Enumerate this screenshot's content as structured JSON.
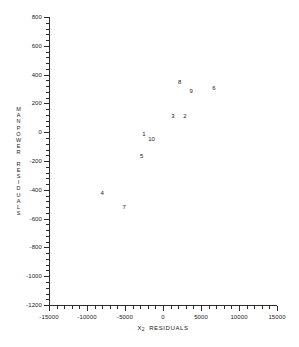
{
  "chart_data": {
    "type": "scatter",
    "title": "",
    "xlabel": "X₂ RESIDUALS",
    "ylabel": "MANPOWER RESIDUALS",
    "xlim": [
      -15000,
      15000
    ],
    "ylim": [
      -1200,
      800
    ],
    "grid": false,
    "legend": "none",
    "xticks": [
      -15000,
      -10000,
      -5000,
      0,
      5000,
      10000,
      15000
    ],
    "xtick_labels": [
      "-15000",
      "-10000",
      "-5000",
      "0",
      "5000",
      "10000",
      "15000"
    ],
    "yticks": [
      800,
      600,
      400,
      200,
      0,
      -200,
      -400,
      -600,
      -800,
      -1000,
      -1200
    ],
    "ytick_labels": [
      "800",
      "600",
      "400",
      "200",
      "0",
      "-200",
      "-400",
      "-600",
      "-800",
      "-1000",
      "-1200"
    ],
    "point_labels": [
      "1",
      "2",
      "3",
      "4",
      "5",
      "6",
      "7",
      "8",
      "9",
      "10"
    ],
    "points": [
      {
        "label": "1",
        "x": -2500,
        "y": -10
      },
      {
        "label": "10",
        "x": -1500,
        "y": -45
      },
      {
        "label": "5",
        "x": -2800,
        "y": -165
      },
      {
        "label": "3",
        "x": 1300,
        "y": 110
      },
      {
        "label": "2",
        "x": 2900,
        "y": 115
      },
      {
        "label": "8",
        "x": 2200,
        "y": 350
      },
      {
        "label": "9",
        "x": 3700,
        "y": 285
      },
      {
        "label": "6",
        "x": 6700,
        "y": 305
      },
      {
        "label": "4",
        "x": -8000,
        "y": -420
      },
      {
        "label": "7",
        "x": -5100,
        "y": -520
      }
    ]
  },
  "axes": {
    "y_title_chars": [
      "M",
      "A",
      "N",
      "P",
      "O",
      "W",
      "E",
      "R",
      "R",
      "E",
      "S",
      "I",
      "D",
      "U",
      "A",
      "L",
      "S"
    ],
    "x_title_main": "RESIDUALS",
    "x_title_var": "X",
    "x_title_sub": "2"
  }
}
